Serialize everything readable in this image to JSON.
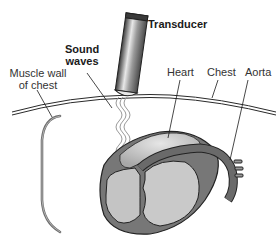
{
  "diagram": {
    "labels": {
      "transducer": "Transducer",
      "sound_waves_line1": "Sound",
      "sound_waves_line2": "waves",
      "muscle_wall_line1": "Muscle wall",
      "muscle_wall_line2": "of chest",
      "heart": "Heart",
      "chest": "Chest",
      "aorta": "Aorta"
    },
    "colors": {
      "outline": "#2a2a2a",
      "heart_fill": "#bdbdbd",
      "heart_dark": "#6e6e6e",
      "heart_light": "#d9d9d9",
      "transducer_body": "#8a8a8a",
      "muscle": "#7a7a7a",
      "background": "#ffffff"
    }
  }
}
